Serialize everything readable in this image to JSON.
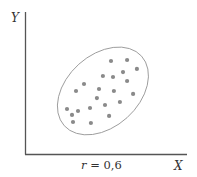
{
  "chart_data": {
    "type": "scatter",
    "title": "",
    "xlabel": "X",
    "ylabel": "Y",
    "annotation": {
      "text_var": "r",
      "text_eq": " = 0,6"
    },
    "xlim": [
      0,
      100
    ],
    "ylim": [
      0,
      100
    ],
    "grid": false,
    "legend": null,
    "ticks": false,
    "correlation": 0.6,
    "points": [
      {
        "x": 53.1,
        "y": 65.5
      },
      {
        "x": 63.0,
        "y": 66.2
      },
      {
        "x": 69.1,
        "y": 59.9
      },
      {
        "x": 60.5,
        "y": 57.7
      },
      {
        "x": 48.1,
        "y": 54.9
      },
      {
        "x": 54.3,
        "y": 54.2
      },
      {
        "x": 63.0,
        "y": 51.4
      },
      {
        "x": 36.4,
        "y": 49.3
      },
      {
        "x": 31.5,
        "y": 44.4
      },
      {
        "x": 45.7,
        "y": 45.8
      },
      {
        "x": 54.9,
        "y": 44.4
      },
      {
        "x": 66.7,
        "y": 42.3
      },
      {
        "x": 44.4,
        "y": 39.4
      },
      {
        "x": 58.6,
        "y": 36.6
      },
      {
        "x": 49.4,
        "y": 34.5
      },
      {
        "x": 25.9,
        "y": 31.7
      },
      {
        "x": 32.7,
        "y": 30.3
      },
      {
        "x": 40.1,
        "y": 32.4
      },
      {
        "x": 51.9,
        "y": 26.8
      },
      {
        "x": 29.0,
        "y": 27.5
      },
      {
        "x": 29.6,
        "y": 22.5
      },
      {
        "x": 40.7,
        "y": 21.8
      }
    ],
    "enclosing_ellipse": {
      "cx": 48.1,
      "cy": 44.4,
      "rx": 52,
      "ry": 36,
      "rotation_deg": -42
    }
  },
  "colors": {
    "axis": "#555555",
    "points": "#8a8a8a",
    "ellipse": "#9a9a9a",
    "text": "#333333"
  }
}
